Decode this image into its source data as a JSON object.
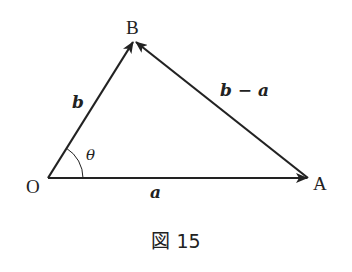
{
  "diagram": {
    "points": {
      "O": {
        "label": "O",
        "x": 48,
        "y": 178
      },
      "A": {
        "label": "A",
        "x": 308,
        "y": 178
      },
      "B": {
        "label": "B",
        "x": 134,
        "y": 41
      }
    },
    "vectors": [
      {
        "from": "O",
        "to": "A",
        "label": "a"
      },
      {
        "from": "O",
        "to": "B",
        "label": "b"
      },
      {
        "from": "A",
        "to": "B",
        "label": "b − a"
      }
    ],
    "angle": {
      "at": "O",
      "label": "θ"
    },
    "colors": {
      "stroke": "#222222",
      "background": "#ffffff"
    }
  },
  "caption": "図 15"
}
